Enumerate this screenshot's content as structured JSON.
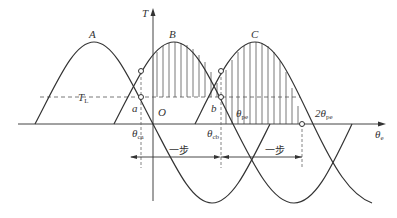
{
  "diagram": {
    "type": "stepper-motor torque-angle characteristic",
    "axes": {
      "y_label": "T",
      "x_label": "θ",
      "x_label_sub": "e",
      "origin_label": "O"
    },
    "load_torque": {
      "label": "T",
      "label_sub": "L"
    },
    "curves": [
      {
        "name": "A",
        "label": "A"
      },
      {
        "name": "B",
        "label": "B"
      },
      {
        "name": "C",
        "label": "C"
      }
    ],
    "points": {
      "a": "a",
      "b": "b"
    },
    "angle_labels": {
      "theta_ca": {
        "main": "θ",
        "sub": "ca"
      },
      "theta_cb": {
        "main": "θ",
        "sub": "cb"
      },
      "theta_pe": {
        "main": "θ",
        "sub": "pe"
      },
      "two_theta_pe": {
        "main": "2θ",
        "sub": "pe"
      }
    },
    "step_labels": [
      "一步",
      "一步"
    ]
  }
}
